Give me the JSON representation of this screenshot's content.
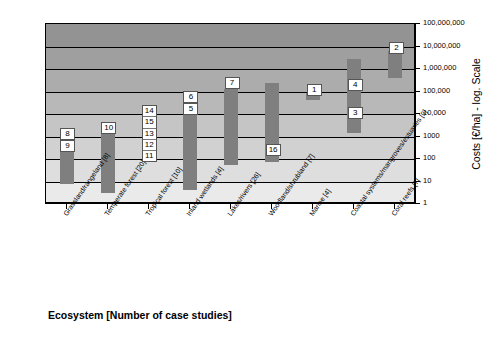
{
  "chart_data": {
    "type": "bar",
    "title": "",
    "xlabel": "Ecosystem [Number of case studies]",
    "ylabel": "Costs [€/ha] - log. Scale",
    "y_scale": "log",
    "ylim": [
      1,
      100000000
    ],
    "grid": true,
    "legend": "none",
    "y_ticks": [
      {
        "value": 100000000,
        "label": "100,000,000"
      },
      {
        "value": 10000000,
        "label": "10,000,000"
      },
      {
        "value": 1000000,
        "label": "1,000,000"
      },
      {
        "value": 100000,
        "label": "100,000"
      },
      {
        "value": 10000,
        "label": "10,000"
      },
      {
        "value": 1000,
        "label": "1000"
      },
      {
        "value": 100,
        "label": "100"
      },
      {
        "value": 10,
        "label": "10"
      },
      {
        "value": 1,
        "label": "1"
      }
    ],
    "categories": [
      "Grassland/rangeland [8]",
      "Temperate forest [20]",
      "Tropical forest [10]",
      "Inland wetlands [4]",
      "Lakes/rivers [26]",
      "Woodland/shrubland [7]",
      "Marine [4]",
      "Coastal systems/mangroves/estuaries [9]",
      "Coral reefs [7]"
    ],
    "bars": [
      {
        "category": "Grassland/rangeland [8]",
        "low": 8,
        "high": 700,
        "labels": [
          "8",
          "9"
        ]
      },
      {
        "category": "Temperate forest [20]",
        "low": 3,
        "high": 1300,
        "labels": [
          "10"
        ]
      },
      {
        "category": "Tropical forest [10]",
        "low": null,
        "high": null,
        "labels": [
          "14",
          "15",
          "13",
          "12",
          "11"
        ]
      },
      {
        "category": "Inland wetlands [4]",
        "low": 4,
        "high": 30000,
        "labels": [
          "6",
          "5"
        ]
      },
      {
        "category": "Lakes/rivers [26]",
        "low": 55,
        "high": 130000,
        "labels": [
          "7"
        ]
      },
      {
        "category": "Woodland/shrubland [7]",
        "low": 70,
        "high": 250000,
        "labels": [
          "16"
        ]
      },
      {
        "category": "Marine [4]",
        "low": 40000,
        "high": 85000,
        "labels": [
          "1"
        ]
      },
      {
        "category": "Coastal systems/mangroves/estuaries [9]",
        "low": 1400,
        "high": 2800000,
        "labels": [
          "4",
          "3"
        ]
      },
      {
        "category": "Coral reefs [7]",
        "low": 400000,
        "high": 6500000,
        "labels": [
          "2"
        ]
      }
    ],
    "colors": {
      "bar": "#7f7f7f",
      "axis": "#000000",
      "plot_background_top": "#9a9a9a",
      "plot_background_bottom": "#e8e8e8"
    }
  }
}
